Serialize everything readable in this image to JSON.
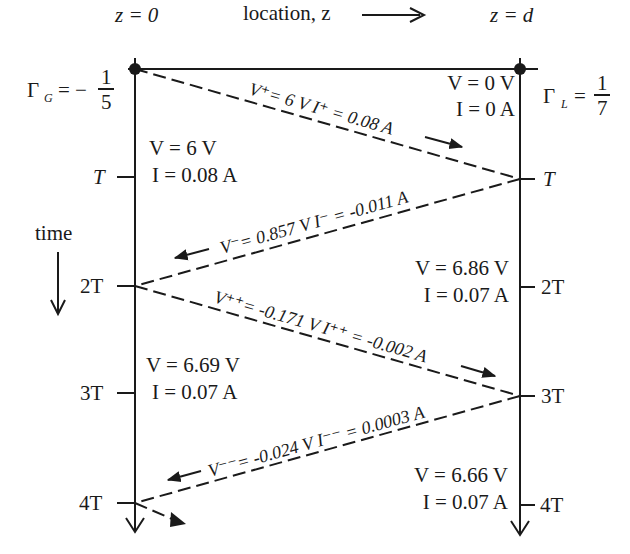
{
  "header": {
    "z0_label": "z = 0",
    "zd_label": "z = d",
    "location_label": "location, z"
  },
  "reflection": {
    "gamma_g_symbol": "Γ",
    "gamma_g_sub": "G",
    "gamma_g_eq": "= −",
    "gamma_g_num": "1",
    "gamma_g_den": "5",
    "gamma_l_symbol": "Γ",
    "gamma_l_sub": "L",
    "gamma_l_eq": "=",
    "gamma_l_num": "1",
    "gamma_l_den": "7"
  },
  "time_axis": {
    "label": "time",
    "left_ticks": [
      "T",
      "2T",
      "3T",
      "4T"
    ],
    "right_ticks": [
      "T",
      "2T",
      "3T",
      "4T"
    ]
  },
  "states": [
    {
      "side": "right",
      "V": "V = 0 V",
      "I": "I = 0 A"
    },
    {
      "side": "left",
      "V": "V = 6 V",
      "I": "I = 0.08 A"
    },
    {
      "side": "right",
      "V": "V = 6.86 V",
      "I": "I = 0.07 A"
    },
    {
      "side": "left",
      "V": "V = 6.69 V",
      "I": "I = 0.07 A"
    },
    {
      "side": "right",
      "V": "V = 6.66 V",
      "I": "I = 0.07 A"
    }
  ],
  "waves": [
    {
      "direction": "forward",
      "label": "V⁺= 6 V   I⁺ = 0.08 A"
    },
    {
      "direction": "backward",
      "label": "V⁻= 0.857 V   I⁻ = -0.011 A"
    },
    {
      "direction": "forward",
      "label": "V⁺⁺= -0.171 V   I⁺⁺ = -0.002 A"
    },
    {
      "direction": "backward",
      "label": "V⁻⁻= -0.024 V   I⁻⁻ = 0.0003 A"
    }
  ],
  "colors": {
    "ink": "#1a1a1a",
    "background": "#ffffff"
  }
}
